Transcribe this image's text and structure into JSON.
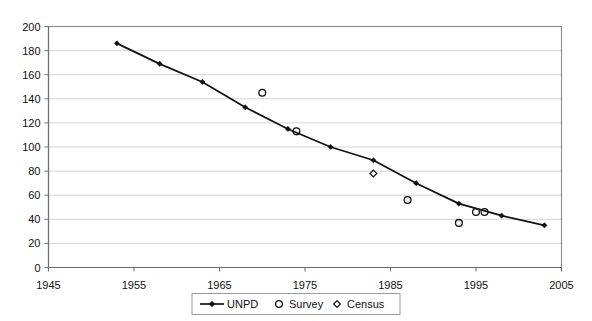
{
  "chart_data": {
    "type": "line",
    "title": "",
    "subtitle": "",
    "xlabel": "",
    "ylabel": "",
    "xlim": [
      1945,
      2005
    ],
    "ylim": [
      0,
      200
    ],
    "x_ticks": [
      1945,
      1955,
      1965,
      1975,
      1985,
      1995,
      2005
    ],
    "y_ticks": [
      0,
      20,
      40,
      60,
      80,
      100,
      120,
      140,
      160,
      180,
      200
    ],
    "grid": "horizontal",
    "legend_position": "bottom-center",
    "series": [
      {
        "name": "UNPD",
        "type": "line",
        "marker": "filled-diamond",
        "color": "#111111",
        "points": [
          {
            "x": 1953,
            "y": 186
          },
          {
            "x": 1958,
            "y": 169
          },
          {
            "x": 1963,
            "y": 154
          },
          {
            "x": 1968,
            "y": 133
          },
          {
            "x": 1973,
            "y": 115
          },
          {
            "x": 1978,
            "y": 100
          },
          {
            "x": 1983,
            "y": 89
          },
          {
            "x": 1988,
            "y": 70
          },
          {
            "x": 1993,
            "y": 53
          },
          {
            "x": 1998,
            "y": 43
          },
          {
            "x": 2003,
            "y": 35
          }
        ]
      },
      {
        "name": "Survey",
        "type": "scatter",
        "marker": "open-circle",
        "color": "#111111",
        "points": [
          {
            "x": 1970,
            "y": 145
          },
          {
            "x": 1974,
            "y": 113
          },
          {
            "x": 1987,
            "y": 56
          },
          {
            "x": 1993,
            "y": 37
          },
          {
            "x": 1995,
            "y": 46
          },
          {
            "x": 1996,
            "y": 46
          }
        ]
      },
      {
        "name": "Census",
        "type": "scatter",
        "marker": "open-diamond",
        "color": "#111111",
        "points": [
          {
            "x": 1983,
            "y": 78
          }
        ]
      }
    ]
  },
  "axis": {
    "y_tick_labels": [
      "200",
      "180",
      "160",
      "140",
      "120",
      "100",
      "80",
      "60",
      "40",
      "20",
      "0"
    ],
    "x_tick_labels": [
      "1945",
      "1955",
      "1965",
      "1975",
      "1985",
      "1995",
      "2005"
    ]
  },
  "legend": {
    "entries": [
      {
        "label": "UNPD",
        "marker": "line-with-filled-diamond"
      },
      {
        "label": "Survey",
        "marker": "open-circle"
      },
      {
        "label": "Census",
        "marker": "open-diamond"
      }
    ]
  },
  "colors": {
    "plot_background": "#ffffff",
    "grid": "#c9c9c9",
    "axis": "#6e6e6e",
    "series": "#111111",
    "border": "#8a8a8a"
  }
}
